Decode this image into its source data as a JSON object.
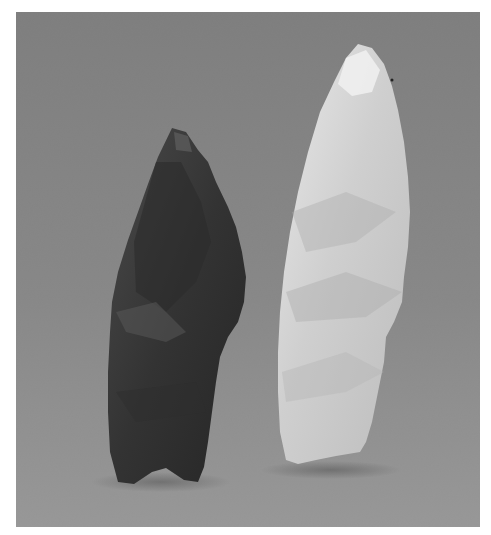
{
  "image": {
    "description": "Grayscale photograph of two chipped stone projectile points standing upright against a mottled gray backdrop",
    "background_color": "#8a8a8a",
    "objects": [
      {
        "name": "dark-projectile-point",
        "tone": "#3a3a3a",
        "position": "left"
      },
      {
        "name": "light-projectile-point",
        "tone": "#d4d4d4",
        "position": "right"
      }
    ]
  }
}
